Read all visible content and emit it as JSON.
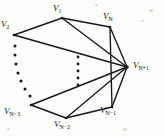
{
  "figure": {
    "name": "graph-diagram",
    "background_color": "#fdfdfc",
    "ink_color": "#14161a"
  },
  "vertices": [
    {
      "id": "v1",
      "base": "V",
      "sub": "1",
      "x": 62,
      "y": 18,
      "label_x": 53,
      "label_y": 4,
      "node": true
    },
    {
      "id": "vN",
      "base": "V",
      "sub": "N",
      "x": 110,
      "y": 27,
      "label_x": 103,
      "label_y": 12,
      "node": true
    },
    {
      "id": "v2",
      "base": "V",
      "sub": "2",
      "x": 14,
      "y": 35,
      "label_x": 1,
      "label_y": 20,
      "node": true
    },
    {
      "id": "vNm3",
      "base": "V",
      "sub": "N−3",
      "x": 31,
      "y": 105,
      "label_x": 4,
      "label_y": 107,
      "node": true
    },
    {
      "id": "vNm2",
      "base": "V",
      "sub": "N−2",
      "x": 66,
      "y": 118,
      "label_x": 54,
      "label_y": 120,
      "node": true
    },
    {
      "id": "vNm1",
      "base": "V",
      "sub": "N−1",
      "x": 112,
      "y": 107,
      "label_x": 100,
      "label_y": 106,
      "node": true
    },
    {
      "id": "vNp1",
      "base": "V",
      "sub": "N+1",
      "x": 127,
      "y": 67,
      "label_x": 133,
      "label_y": 61,
      "node": true
    }
  ],
  "edges": [
    {
      "from": "v2",
      "to": "v1"
    },
    {
      "from": "v1",
      "to": "vN"
    },
    {
      "from": "v1",
      "to": "vNp1"
    },
    {
      "from": "v2",
      "to": "vNp1"
    },
    {
      "from": "vN",
      "to": "vNp1"
    },
    {
      "from": "vN",
      "to": "vNm1"
    },
    {
      "from": "vNm3",
      "to": "vNm2"
    },
    {
      "from": "vNm2",
      "to": "vNm1"
    },
    {
      "from": "vNm3",
      "to": "vNp1"
    },
    {
      "from": "vNm2",
      "to": "vNp1"
    },
    {
      "from": "vNm1",
      "to": "vNp1"
    }
  ],
  "ellipses": [
    {
      "id": "left-ellipsis",
      "meaning": "omitted vertices between V2 and VN-3",
      "dots": [
        {
          "x": 15,
          "y": 46,
          "r": 1.5
        },
        {
          "x": 15,
          "y": 55,
          "r": 1.5
        },
        {
          "x": 16,
          "y": 64,
          "r": 1.5
        },
        {
          "x": 18,
          "y": 73,
          "r": 1.5
        },
        {
          "x": 21,
          "y": 81,
          "r": 1.5
        },
        {
          "x": 25,
          "y": 89,
          "r": 1.5
        },
        {
          "x": 30,
          "y": 96,
          "r": 1.5
        }
      ]
    },
    {
      "id": "center-ellipsis",
      "meaning": "omitted edges converging on VN+1",
      "dots": [
        {
          "x": 78,
          "y": 57,
          "r": 1.4
        },
        {
          "x": 78,
          "y": 64,
          "r": 1.4
        },
        {
          "x": 78,
          "y": 71,
          "r": 1.4
        },
        {
          "x": 78,
          "y": 78,
          "r": 1.4
        },
        {
          "x": 78,
          "y": 85,
          "r": 1.4
        }
      ]
    }
  ],
  "specks": [
    {
      "x": 149,
      "y": 9,
      "w": 4,
      "h": 3
    },
    {
      "x": 141,
      "y": 20,
      "w": 3,
      "h": 2
    },
    {
      "x": 7,
      "y": 128,
      "w": 3,
      "h": 2
    },
    {
      "x": 123,
      "y": 128,
      "w": 4,
      "h": 3
    },
    {
      "x": 95,
      "y": 4,
      "w": 3,
      "h": 2
    }
  ]
}
